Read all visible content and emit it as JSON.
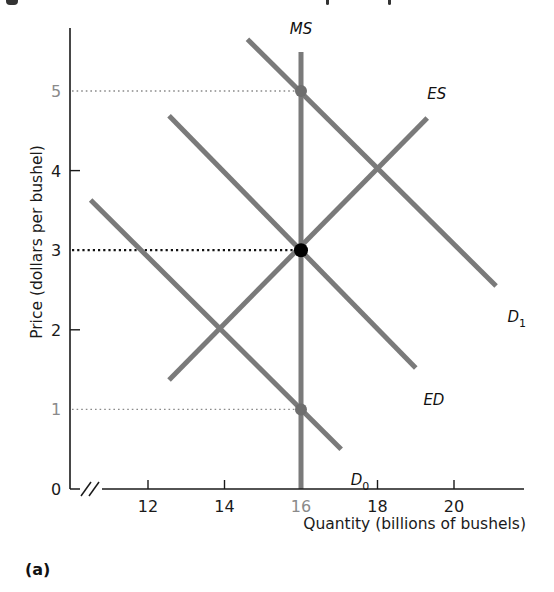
{
  "chart_data": {
    "type": "line",
    "title": "",
    "panel_label": "(a)",
    "xlabel": "Quantity (billions of bushels)",
    "ylabel": "Price (dollars per bushel)",
    "xlim": [
      10,
      22
    ],
    "ylim": [
      0,
      5.7
    ],
    "x_axis_break": true,
    "grid": false,
    "legend": "none (direct curve labels)",
    "x_ticks": [
      {
        "value": 12,
        "label": "12",
        "muted": false
      },
      {
        "value": 14,
        "label": "14",
        "muted": false
      },
      {
        "value": 16,
        "label": "16",
        "muted": true
      },
      {
        "value": 18,
        "label": "18",
        "muted": false
      },
      {
        "value": 20,
        "label": "20",
        "muted": false
      }
    ],
    "y_ticks": [
      {
        "value": 0,
        "label": "0",
        "muted": false
      },
      {
        "value": 1,
        "label": "1",
        "muted": true
      },
      {
        "value": 2,
        "label": "2",
        "muted": false
      },
      {
        "value": 3,
        "label": "3",
        "muted": false
      },
      {
        "value": 4,
        "label": "4",
        "muted": false
      },
      {
        "value": 5,
        "label": "5",
        "muted": true
      }
    ],
    "series": [
      {
        "name": "MS",
        "label": "MS",
        "subscript": "",
        "kind": "vertical",
        "points": [
          [
            16,
            5.5
          ],
          [
            16,
            0
          ]
        ],
        "label_at": [
          16,
          5.72
        ],
        "label_anchor": "middle"
      },
      {
        "name": "D1",
        "label": "D",
        "subscript": "1",
        "points": [
          [
            14.6,
            5.65
          ],
          [
            21.1,
            2.55
          ]
        ],
        "label_at": [
          21.4,
          2.1
        ],
        "label_anchor": "start"
      },
      {
        "name": "ES",
        "label": "ES",
        "subscript": "",
        "points": [
          [
            12.55,
            1.37
          ],
          [
            19.3,
            4.66
          ]
        ],
        "label_at": [
          19.3,
          4.9
        ],
        "label_anchor": "start"
      },
      {
        "name": "ED",
        "label": "ED",
        "subscript": "",
        "points": [
          [
            12.55,
            4.69
          ],
          [
            19.0,
            1.52
          ]
        ],
        "label_at": [
          19.2,
          1.05
        ],
        "label_anchor": "start"
      },
      {
        "name": "D0",
        "label": "D",
        "subscript": "0",
        "points": [
          [
            10.5,
            3.63
          ],
          [
            17.05,
            0.5
          ]
        ],
        "label_at": [
          17.3,
          0.05
        ],
        "label_anchor": "start"
      }
    ],
    "reference_lines": [
      {
        "price": 5,
        "to_quantity": 16,
        "style": "dotted",
        "color": "#8a8a8a"
      },
      {
        "price": 3,
        "to_quantity": 16,
        "style": "dotted",
        "color": "#111111"
      },
      {
        "price": 1,
        "to_quantity": 16,
        "style": "dotted",
        "color": "#8a8a8a"
      }
    ],
    "points": [
      {
        "name": "price-5-point",
        "x": 16,
        "y": 5,
        "color": "#6e6e6e"
      },
      {
        "name": "equilibrium-point",
        "x": 16,
        "y": 3,
        "color": "#000000"
      },
      {
        "name": "price-1-point",
        "x": 16,
        "y": 1,
        "color": "#6e6e6e"
      }
    ]
  },
  "colors": {
    "curve": "#7a7a7a",
    "axis": "#1a1a1a",
    "muted_text": "#8a8a8a",
    "text": "#1a1a1a"
  }
}
